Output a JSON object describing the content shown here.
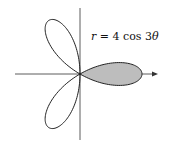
{
  "chart_data": {
    "type": "line",
    "subtype": "polar-rose",
    "title": "",
    "equation": "r = 4 cos 3θ",
    "equation_parts": {
      "lhs": "r",
      "eq": " = 4 cos 3",
      "theta": "θ"
    },
    "petals": 3,
    "amplitude": 4,
    "shaded_petal": "right (centered on positive x-axis, θ ∈ [-π/6, π/6])",
    "petal_directions_deg": [
      0,
      120,
      240
    ],
    "axes": {
      "x_arrow": true,
      "y_arrow": false,
      "grid": false,
      "tick_labels": []
    },
    "colors": {
      "curve": "#222222",
      "shade": "#bdbdbd",
      "axes": "#333333"
    }
  }
}
